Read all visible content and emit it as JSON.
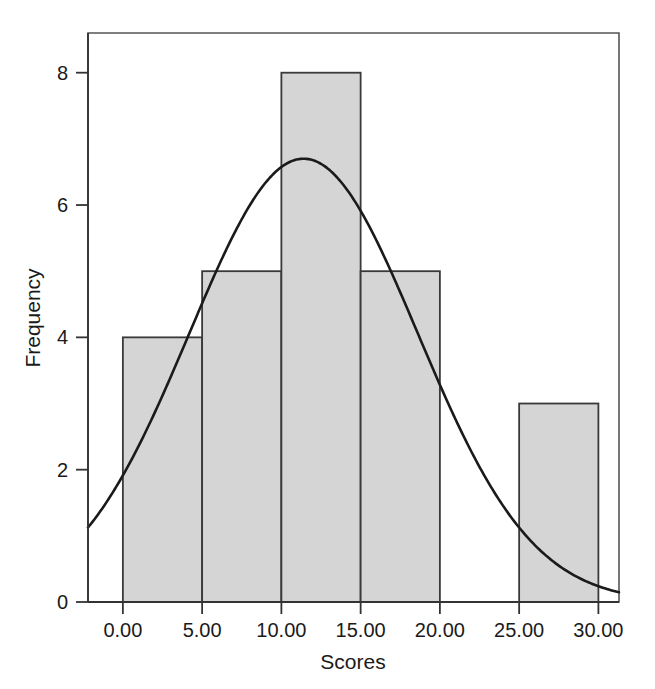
{
  "chart_data": {
    "type": "bar",
    "title": "",
    "subtitle": "",
    "xlabel": "Scores",
    "ylabel": "Frequency",
    "xlim": [
      -2.2,
      31.3
    ],
    "ylim": [
      0,
      8.6
    ],
    "grid": false,
    "legend": null,
    "bin_width": 5,
    "bin_edges": [
      0,
      5,
      10,
      15,
      20,
      25,
      30
    ],
    "categories": [
      "0-5",
      "5-10",
      "10-15",
      "15-20",
      "20-25",
      "25-30"
    ],
    "values": [
      4,
      5,
      8,
      5,
      0,
      3
    ],
    "bar_fill": "#d5d5d5",
    "bar_stroke": "#3a3a3a",
    "xticks": [
      0,
      5,
      10,
      15,
      20,
      25,
      30
    ],
    "xtick_labels": [
      "0.00",
      "5.00",
      "10.00",
      "15.00",
      "20.00",
      "25.00",
      "30.00"
    ],
    "yticks": [
      0,
      2,
      4,
      6,
      8
    ],
    "ytick_labels": [
      "0",
      "2",
      "4",
      "6",
      "8"
    ],
    "overlay_curve": {
      "name": "normal-distribution-curve",
      "type": "line",
      "color": "#1a1a1a",
      "mean": 11.4,
      "sigma": 7.2,
      "peak_value": 6.7,
      "peak_x": 11.4,
      "start_point": [
        -2.2,
        1.35
      ],
      "end_point": [
        31.3,
        0.3
      ],
      "x": [
        -2.2,
        0,
        2.5,
        5,
        7.5,
        10,
        11.4,
        12.5,
        15,
        17.5,
        20,
        22.5,
        25,
        27.5,
        30,
        31.3
      ],
      "y": [
        1.35,
        2.0,
        3.2,
        4.45,
        5.6,
        6.5,
        6.7,
        6.65,
        6.1,
        5.1,
        3.8,
        2.55,
        1.5,
        0.8,
        0.37,
        0.3
      ]
    }
  },
  "axis_titles": {
    "x": "Scores",
    "y": "Frequency"
  }
}
